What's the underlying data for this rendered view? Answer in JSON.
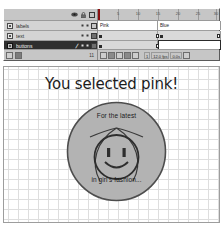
{
  "timeline": {
    "panel_name": "Timeline",
    "column_icons": [
      "eye-icon",
      "lock-icon",
      "outline-square-icon"
    ],
    "layers": [
      {
        "name": "labels",
        "visible": true,
        "locked": false,
        "outline": false,
        "selected": false
      },
      {
        "name": "text",
        "visible": true,
        "locked": false,
        "outline": true,
        "selected": false
      },
      {
        "name": "buttons",
        "visible": true,
        "locked": false,
        "outline": true,
        "selected": true,
        "editing": true
      }
    ],
    "footer": {
      "buttons": [
        "insert-layer-button",
        "add-motion-guide-button"
      ],
      "layer_count": "11"
    },
    "ruler": {
      "ticks": [
        5,
        10,
        15,
        20,
        25,
        30
      ],
      "playhead_frame": 1
    },
    "frame_labels": [
      {
        "text": "Pink",
        "frame": 1
      },
      {
        "text": "Blue",
        "frame": 16
      }
    ],
    "keyframes": [
      1,
      16
    ],
    "playback": {
      "controls": [
        "center-frame-button",
        "onion-skin-button",
        "onion-skin-outlines-button",
        "edit-multiple-frames-button",
        "modify-onion-markers-button"
      ],
      "current_frame": "1",
      "fps": "12.0 fps",
      "elapsed": "0.0s"
    }
  },
  "stage": {
    "headline": "You selected pink!",
    "logo": {
      "top_text": "For the latest",
      "bottom_text": "in girl's fashion...",
      "face": "smiley-face"
    }
  },
  "colors": {
    "panel_bg": "#c6c6c6",
    "selected_layer": "#2f2f2f",
    "playhead": "#8a1111",
    "logo_fill": "#b3b3b3",
    "stage_bg": "#ffffff",
    "grid_line": "#dedede"
  }
}
